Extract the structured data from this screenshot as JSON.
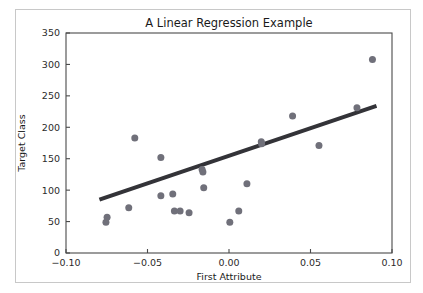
{
  "chart_data": {
    "type": "scatter",
    "title": "A Linear Regression Example",
    "xlabel": "First Attribute",
    "ylabel": "Target Class",
    "xlim": [
      -0.1,
      0.1
    ],
    "ylim": [
      0,
      350
    ],
    "xticks": [
      -0.1,
      -0.05,
      0.0,
      0.05,
      0.1
    ],
    "xticklabels": [
      "−0.10",
      "−0.05",
      "0.00",
      "0.05",
      "0.10"
    ],
    "yticks": [
      0,
      50,
      100,
      150,
      200,
      250,
      300,
      350
    ],
    "yticklabels": [
      "0",
      "50",
      "100",
      "150",
      "200",
      "250",
      "300",
      "350"
    ],
    "grid": false,
    "legend": null,
    "marker_color": "#70707a",
    "marker_size": 5.0,
    "line_color": "#333338",
    "line_width": 4.0,
    "scatter": {
      "name": "Observations",
      "x": [
        -0.0755,
        -0.0748,
        -0.0615,
        -0.0578,
        -0.0418,
        -0.0418,
        -0.0345,
        -0.0335,
        -0.03,
        -0.0245,
        -0.0165,
        -0.016,
        -0.0155,
        0.0005,
        0.006,
        0.011,
        0.0198,
        0.02,
        0.039,
        0.0552,
        0.0785,
        0.088
      ],
      "y": [
        49.0,
        57.0,
        72.0,
        183.0,
        152.0,
        91.0,
        94.0,
        67.0,
        67.0,
        64.0,
        133.0,
        129.0,
        104.0,
        49.0,
        67.0,
        110.0,
        177.0,
        174.0,
        218.0,
        171.0,
        231.0,
        308.0
      ]
    },
    "regression_line": {
      "name": "Linear fit",
      "x": [
        -0.0795,
        0.0905
      ],
      "y": [
        85.0,
        234.0
      ],
      "slope": 876.5,
      "intercept": 154.7
    }
  },
  "figure": {
    "width": 423,
    "height": 293,
    "background": "#ffffff",
    "frame_color": "#c8c8c8"
  }
}
